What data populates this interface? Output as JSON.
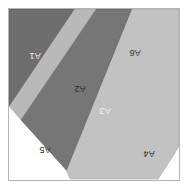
{
  "figure": {
    "title": "",
    "background_color": "#ffffff",
    "frame": {
      "border_color": "#b4b4b4",
      "fill_color": "#ffffff",
      "x": 8,
      "y": 8,
      "width": 172,
      "height": 173
    },
    "label_rotation_degrees": 180,
    "regions": [
      {
        "id": "A1",
        "label": "A1",
        "fill": "#6e6e6e",
        "stroke": "#555555",
        "tone": "dark",
        "points": "0,0 0,98 66,0",
        "label_x": 26,
        "label_y": 46
      },
      {
        "id": "A2",
        "label": "A2",
        "fill": "#b9b9b9",
        "stroke": "#9a9a9a",
        "tone": "light",
        "points": "66,0 0,98 12,112 88,0",
        "label_x": 71,
        "label_y": 79
      },
      {
        "id": "A3",
        "label": "A3",
        "fill": "#767676",
        "stroke": "#5c5c5c",
        "tone": "dark",
        "points": "88,0 12,112 58,163 124,0",
        "label_x": 96,
        "label_y": 101
      },
      {
        "id": "A4",
        "label": "A4",
        "fill": "#c2c2c2",
        "stroke": "#9a9a9a",
        "tone": "light",
        "points": "124,0 58,163 62,172 151,172 172,139 172,0",
        "label_x": 140,
        "label_y": 144
      },
      {
        "id": "A5",
        "label": "A5",
        "fill": "#ffffff",
        "stroke": "#ffffff",
        "tone": "light",
        "points": "0,98 0,172 62,172 12,112",
        "label_x": 36,
        "label_y": 140
      },
      {
        "id": "A6",
        "label": "A6",
        "fill": "#ffffff",
        "stroke": "#ffffff",
        "tone": "light",
        "points": "88,0 172,0 172,0",
        "label_x": 126,
        "label_y": 43
      }
    ]
  }
}
